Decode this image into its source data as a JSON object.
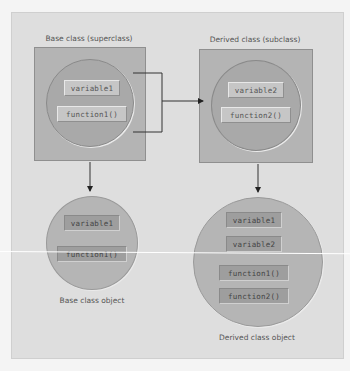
{
  "diagram": {
    "base_class": {
      "caption": "Base class (superclass)",
      "members": [
        "variable1",
        "function1()"
      ]
    },
    "derived_class": {
      "caption": "Derived class (subclass)",
      "members": [
        "variable2",
        "function2()"
      ]
    },
    "base_object": {
      "caption": "Base class object",
      "members": [
        "variable1",
        "function1()"
      ]
    },
    "derived_object": {
      "caption": "Derived class object",
      "members": [
        "variable1",
        "variable2",
        "function1()",
        "function2()"
      ]
    },
    "edges": [
      {
        "from": "base_class",
        "to": "derived_class",
        "type": "inherits-bracket-arrow"
      },
      {
        "from": "base_class",
        "to": "base_object",
        "type": "instantiates-arrow"
      },
      {
        "from": "derived_class",
        "to": "derived_object",
        "type": "instantiates-arrow"
      }
    ],
    "colors": {
      "background": "#dedede",
      "class_box": "#b4b4b4",
      "circle": "#a9a9a9",
      "object_circle": "#b5b5b5",
      "member_box": "#c6c6c6",
      "member_box_dark": "#9e9e9e",
      "line": "#333333"
    }
  }
}
